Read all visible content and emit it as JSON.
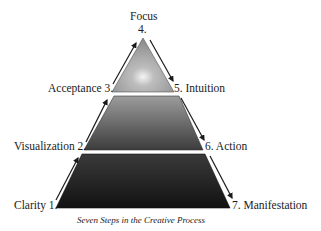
{
  "diagram": {
    "title_top": "Focus",
    "caption": "Seven Steps in the Creative Process",
    "steps": [
      {
        "number": "1.",
        "name": "Clarity",
        "label": "Clarity 1."
      },
      {
        "number": "2.",
        "name": "Visualization",
        "label": "Visualization 2."
      },
      {
        "number": "3.",
        "name": "Acceptance",
        "label": "Acceptance 3."
      },
      {
        "number": "4.",
        "name": "Focus",
        "label": "4."
      },
      {
        "number": "5.",
        "name": "Intuition",
        "label": "5. Intuition"
      },
      {
        "number": "6.",
        "name": "Action",
        "label": "6. Action"
      },
      {
        "number": "7.",
        "name": "Manifestation",
        "label": "7. Manifestation"
      }
    ],
    "tiers": [
      {
        "name": "top",
        "color_light": "#d8d8d8",
        "color_dark": "#8c8c8c"
      },
      {
        "name": "middle",
        "color_light": "#9a9a9a",
        "color_dark": "#4a4a4a"
      },
      {
        "name": "bottom",
        "color_light": "#3a3a3a",
        "color_dark": "#111111"
      }
    ]
  }
}
